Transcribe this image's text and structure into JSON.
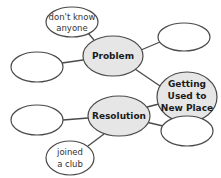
{
  "diagram": {
    "colors": {
      "stroke": "#4a4a4a",
      "main_fill": "#e6e6e6",
      "empty_fill": "#ffffff"
    },
    "nodes": {
      "center": {
        "lines": [
          "Getting",
          "Used to",
          "New Place"
        ]
      },
      "problem": {
        "label": "Problem"
      },
      "resolution": {
        "label": "Resolution"
      },
      "problem_detail": {
        "lines": [
          "don't know",
          "anyone"
        ]
      },
      "resolution_detail": {
        "lines": [
          "joined",
          "a club"
        ]
      },
      "problem_empty_left": {
        "label": ""
      },
      "problem_empty_right": {
        "label": ""
      },
      "resolution_empty_left": {
        "label": ""
      },
      "resolution_empty_right": {
        "label": ""
      }
    },
    "edges": [
      [
        "problem",
        "problem_detail"
      ],
      [
        "problem",
        "problem_empty_left"
      ],
      [
        "problem",
        "problem_empty_right"
      ],
      [
        "problem",
        "center"
      ],
      [
        "resolution",
        "center"
      ],
      [
        "resolution",
        "resolution_empty_left"
      ],
      [
        "resolution",
        "resolution_empty_right"
      ],
      [
        "resolution",
        "resolution_detail"
      ]
    ]
  }
}
